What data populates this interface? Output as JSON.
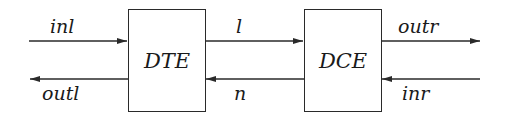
{
  "diagram": {
    "type": "block-diagram",
    "nodes": [
      {
        "id": "dte",
        "label": "DTE"
      },
      {
        "id": "dce",
        "label": "DCE"
      }
    ],
    "edges": [
      {
        "id": "inl",
        "label": "inl",
        "from": "external-left",
        "to": "dte",
        "direction": "right"
      },
      {
        "id": "outl",
        "label": "outl",
        "from": "dte",
        "to": "external-left",
        "direction": "left"
      },
      {
        "id": "l",
        "label": "l",
        "from": "dte",
        "to": "dce",
        "direction": "right"
      },
      {
        "id": "n",
        "label": "n",
        "from": "dce",
        "to": "dte",
        "direction": "left"
      },
      {
        "id": "outr",
        "label": "outr",
        "from": "dce",
        "to": "external-right",
        "direction": "right"
      },
      {
        "id": "inr",
        "label": "inr",
        "from": "external-right",
        "to": "dce",
        "direction": "left"
      }
    ]
  },
  "colors": {
    "stroke": "#2a2a2a",
    "text": "#1a1a1a",
    "background": "#ffffff"
  }
}
